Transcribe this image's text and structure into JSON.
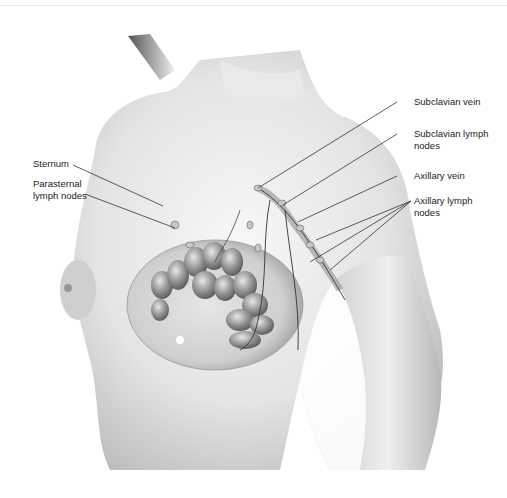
{
  "figure": {
    "labels_left": [
      {
        "id": "sternum",
        "text": "Sternum"
      },
      {
        "id": "parasternal",
        "text": "Parasternal\nlymph nodes"
      }
    ],
    "labels_right": [
      {
        "id": "subclavian-vein",
        "text": "Subclavian vein"
      },
      {
        "id": "subclavian-lymph",
        "text": "Subclavian lymph\nnodes"
      },
      {
        "id": "axillary-vein",
        "text": "Axillary vein"
      },
      {
        "id": "axillary-lymph",
        "text": "Axillary lymph\nnodes"
      }
    ]
  },
  "colors": {
    "background": "#ffffff",
    "skin_light": "#f2f2f2",
    "skin_mid": "#cfcfcf",
    "skin_dark": "#8a8a8a",
    "leader_line": "#333333",
    "label_text": "#222222"
  }
}
